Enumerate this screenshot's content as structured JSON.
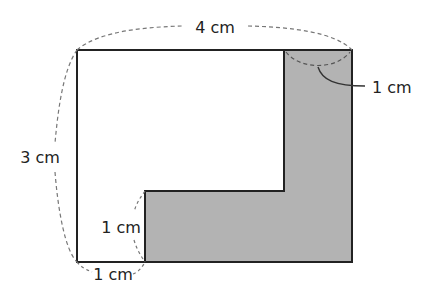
{
  "diagram": {
    "type": "geometry-figure",
    "shade_color": "#b3b3b3",
    "outline_color": "#222222",
    "dash_color": "#777777",
    "labels": {
      "width": "4 cm",
      "height": "3 cm",
      "strip_width": "1 cm",
      "step_height": "1 cm",
      "bottom_gap": "1 cm"
    }
  }
}
